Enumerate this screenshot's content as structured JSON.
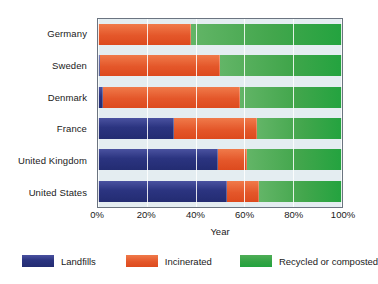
{
  "chart_data": {
    "type": "bar",
    "orientation": "horizontal",
    "stacked": true,
    "normalized": "percent",
    "title": "",
    "xlabel": "Year",
    "ylabel": "",
    "xlim": [
      0,
      100
    ],
    "xticks": [
      "0%",
      "20%",
      "40%",
      "60%",
      "80%",
      "100%"
    ],
    "xtick_values": [
      0,
      20,
      40,
      60,
      80,
      100
    ],
    "grid": true,
    "legend_position": "bottom",
    "categories": [
      "Germany",
      "Sweden",
      "Denmark",
      "France",
      "United Kingdom",
      "United States"
    ],
    "series": [
      {
        "name": "Landfills",
        "color": "#2b3480",
        "values": [
          0,
          1,
          2,
          31,
          49,
          53
        ]
      },
      {
        "name": "Incinerated",
        "color": "#e4572a",
        "values": [
          38,
          49,
          56,
          34,
          12,
          13
        ]
      },
      {
        "name": "Recycled or composted",
        "color": "#23a33f",
        "values": [
          62,
          50,
          42,
          35,
          39,
          34
        ]
      }
    ],
    "plot_background": "#e4edf1",
    "plot_border": "#6b7480"
  },
  "axis": {
    "x_title": "Year",
    "ticks": [
      {
        "label": "0%",
        "pct": 0
      },
      {
        "label": "20%",
        "pct": 20
      },
      {
        "label": "40%",
        "pct": 40
      },
      {
        "label": "60%",
        "pct": 60
      },
      {
        "label": "80%",
        "pct": 80
      },
      {
        "label": "100%",
        "pct": 100
      }
    ]
  },
  "categories": [
    {
      "label": "Germany"
    },
    {
      "label": "Sweden"
    },
    {
      "label": "Denmark"
    },
    {
      "label": "France"
    },
    {
      "label": "United Kingdom"
    },
    {
      "label": "United States"
    }
  ],
  "legend": {
    "items": [
      {
        "label": "Landfills",
        "color": "#2b3480"
      },
      {
        "label": "Incinerated",
        "color": "#e4572a"
      },
      {
        "label": "Recycled or composted",
        "color": "#23a33f"
      }
    ]
  }
}
